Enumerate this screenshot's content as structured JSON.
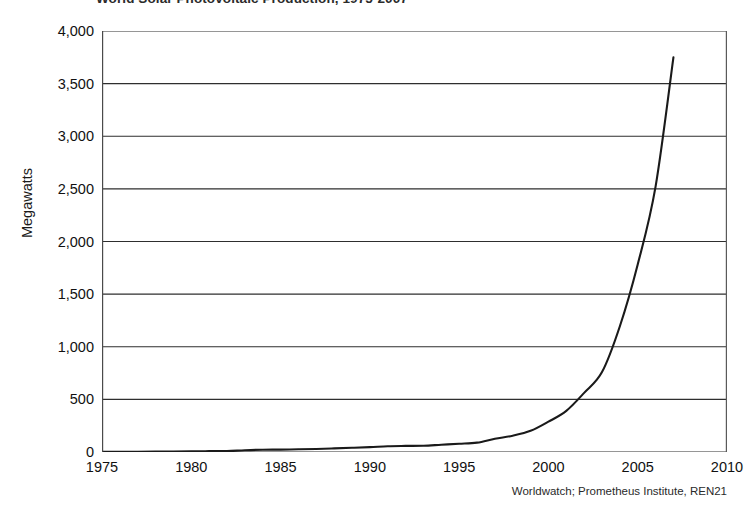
{
  "chart_data": {
    "type": "line",
    "title": "World Solar Photovoltaic Production, 1975-2007",
    "xlabel": "",
    "ylabel": "Megawatts",
    "xlim": [
      1975,
      2010
    ],
    "ylim": [
      0,
      4000
    ],
    "xticks": [
      "1975",
      "1980",
      "1985",
      "1990",
      "1995",
      "2000",
      "2005",
      "2010"
    ],
    "yticks": [
      "0",
      "500",
      "1,000",
      "1,500",
      "2,000",
      "2,500",
      "3,000",
      "3,500",
      "4,000"
    ],
    "grid": "horizontal",
    "legend": "none",
    "line_color": "#1a1a1a",
    "source": "Worldwatch; Prometheus Institute, REN21",
    "x": [
      1975,
      1976,
      1977,
      1978,
      1979,
      1980,
      1981,
      1982,
      1983,
      1984,
      1985,
      1986,
      1987,
      1988,
      1989,
      1990,
      1991,
      1992,
      1993,
      1994,
      1995,
      1996,
      1997,
      1998,
      1999,
      2000,
      2001,
      2002,
      2003,
      2004,
      2005,
      2006,
      2007
    ],
    "values": [
      2,
      2,
      3,
      4,
      5,
      7,
      8,
      9,
      17,
      22,
      23,
      26,
      29,
      34,
      40,
      46,
      55,
      58,
      60,
      69,
      78,
      89,
      126,
      155,
      201,
      288,
      391,
      562,
      759,
      1195,
      1782,
      2521,
      3750
    ],
    "series": [
      {
        "name": "World solar photovoltaic production",
        "values": [
          2,
          2,
          3,
          4,
          5,
          7,
          8,
          9,
          17,
          22,
          23,
          26,
          29,
          34,
          40,
          46,
          55,
          58,
          60,
          69,
          78,
          89,
          126,
          155,
          201,
          288,
          391,
          562,
          759,
          1195,
          1782,
          2521,
          3750
        ]
      }
    ],
    "annotations": []
  }
}
